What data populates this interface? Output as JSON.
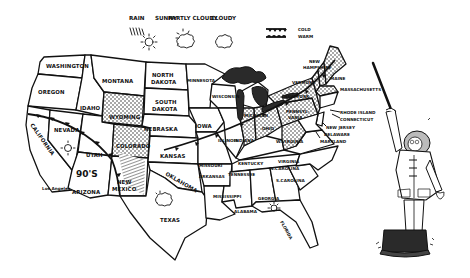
{
  "legend": {
    "items": [
      {
        "label": "RAIN",
        "icon": "rain-icon"
      },
      {
        "label": "SUNNY",
        "icon": "sun-icon"
      },
      {
        "label": "PARTLY CLOUDY",
        "icon": "partly-cloudy-icon"
      },
      {
        "label": "CLOUDY",
        "icon": "cloud-icon"
      }
    ],
    "fronts": [
      {
        "label": "COLD",
        "icon": "cold-front-icon"
      },
      {
        "label": "WARM",
        "icon": "warm-front-icon"
      }
    ]
  },
  "states": {
    "washington": "WASHINGTON",
    "oregon": "OREGON",
    "california": "CALIFORNIA",
    "los_angeles": "Los Angeles",
    "nevada": "NEVADA",
    "idaho": "IDAHO",
    "montana": "MONTANA",
    "wyoming": "WYOMING",
    "utah": "UTAH",
    "arizona": "ARIZONA",
    "colorado": "COLORADO",
    "new_mexico_1": "NEW",
    "new_mexico_2": "MEXICO",
    "north_dakota_1": "NORTH",
    "north_dakota_2": "DAKOTA",
    "south_dakota_1": "SOUTH",
    "south_dakota_2": "DAKOTA",
    "nebraska": "NEBRASKA",
    "kansas": "KANSAS",
    "oklahoma": "OKLAHOMA",
    "texas": "TEXAS",
    "minnesota": "MINNESOTA",
    "iowa": "IOWA",
    "missouri": "MISSOURI",
    "arkansas": "ARKANSAS",
    "louisiana": "",
    "wisconsin": "WISCONSIN",
    "illinois": "ILLINOIS",
    "michigan": "MICHIGAN",
    "indiana": "INDIANA",
    "ohio": "OHIO",
    "kentucky": "KENTUCKY",
    "tennessee": "TENNESSEE",
    "mississippi": "MISSISSIPPI",
    "alabama": "ALABAMA",
    "georgia": "GEORGIA",
    "florida": "FLORIDA",
    "south_carolina": "S.CAROLINA",
    "north_carolina": "N.CAROLINA",
    "virginia": "VIRGINIA",
    "west_virginia": "W.VIRGINIA",
    "pennsylvania_1": "PENNSYL-",
    "pennsylvania_2": "VANIA",
    "new_york": "NEW YORK",
    "vermont": "VERMONT",
    "new_hampshire_1": "NEW",
    "new_hampshire_2": "HAMPSHIRE",
    "maine": "MAINE",
    "massachusetts": "MASSACHUSETTS",
    "rhode_island": "RHODE ISLAND",
    "connecticut": "CONNECTICUT",
    "new_jersey": "NEW JERSEY",
    "delaware": "DELAWARE",
    "maryland": "MARYLAND"
  },
  "annotations": {
    "temperature": "90'S"
  }
}
